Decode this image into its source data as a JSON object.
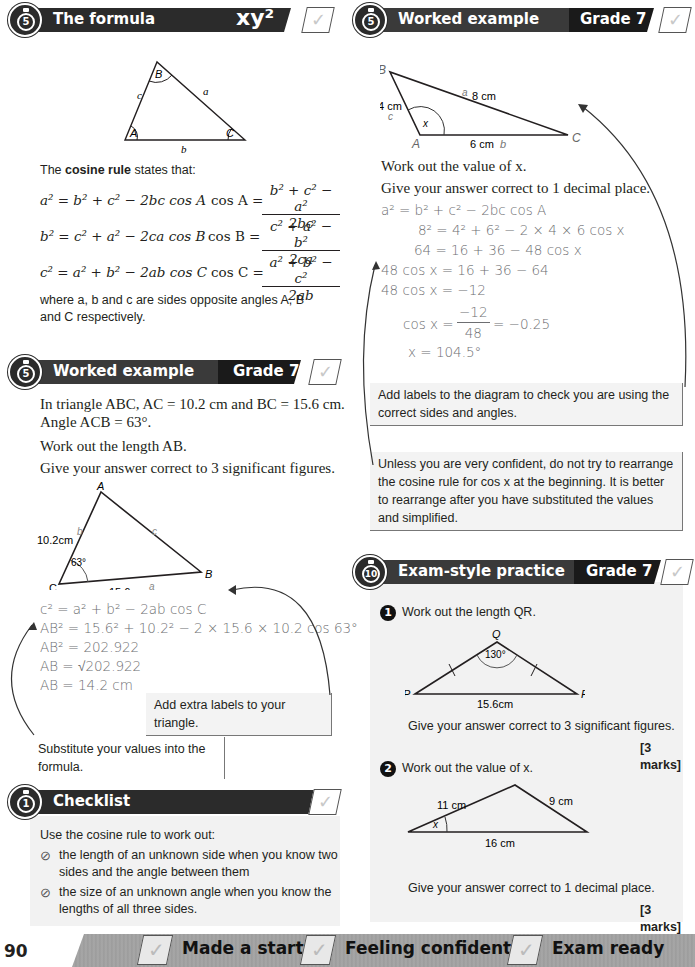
{
  "page_number": "90",
  "formula_section": {
    "timer": "5",
    "title": "The formula",
    "badge": "xy²",
    "triangle": {
      "vertices": [
        "A",
        "B",
        "C"
      ],
      "sides": [
        "a",
        "b",
        "c"
      ]
    },
    "intro_pre": "The ",
    "intro_bold": "cosine rule",
    "intro_post": " states that:",
    "rules": [
      {
        "lhs": "a² = b² + c² − 2bc cos A",
        "cos": "cos A =",
        "num": "b² + c² − a²",
        "den": "2bc"
      },
      {
        "lhs": "b² = c² + a² − 2ca cos B",
        "cos": "cos B =",
        "num": "c² + a² − b²",
        "den": "2ca"
      },
      {
        "lhs": "c² = a² + b² − 2ab cos C",
        "cos": "cos C =",
        "num": "a² + b² − c²",
        "den": "2ab"
      }
    ],
    "where": "where a, b and c are sides opposite angles A, B and C respectively."
  },
  "worked_example_1": {
    "timer": "5",
    "title": "Worked example",
    "grade": "Grade 7",
    "question": [
      "In triangle ABC, AC = 10.2 cm and BC = 15.6 cm. Angle ACB = 63°.",
      "Work out the length AB.",
      "Give your answer correct to 3 significant figures."
    ],
    "triangle": {
      "A": "A",
      "B": "B",
      "C": "C",
      "side_b": "b",
      "side_c": "c",
      "side_a": "a",
      "len_ac": "10.2 cm",
      "len_bc": "15.6 cm",
      "angle": "63°"
    },
    "working": [
      "c² = a² + b² − 2ab cos C",
      "AB² = 15.6² + 10.2² − 2 × 15.6 × 10.2 cos 63°",
      "AB² = 202.922",
      "AB = √202.922",
      "AB = 14.2 cm"
    ],
    "note_labels": "Add extra labels to your triangle.",
    "note_substitute": "Substitute your values into the formula."
  },
  "checklist": {
    "timer": "1",
    "title": "Checklist",
    "intro": "Use the cosine rule to work out:",
    "items": [
      "the length of an unknown side when you know two sides and the angle between them",
      "the size of an unknown angle when you know the lengths of all three sides."
    ]
  },
  "worked_example_2": {
    "timer": "5",
    "title": "Worked example",
    "grade": "Grade 7",
    "triangle": {
      "B": "B",
      "A": "A",
      "C": "C",
      "a": "a",
      "b": "b",
      "c": "c",
      "len_bc": "8 cm",
      "len_ab": "4 cm",
      "len_ac": "6 cm",
      "angle": "x"
    },
    "question": [
      "Work out the value of x.",
      "Give your answer correct to 1 decimal place."
    ],
    "working": [
      "a² = b² + c² − 2bc cos A",
      "8² = 4² + 6² − 2 × 4 × 6 cos x",
      "64 = 16 + 36 − 48 cos x",
      "48 cos x = 16 + 36 − 64",
      "48 cos x = −12",
      "cos x =",
      "−12",
      "48",
      "= −0.25",
      "x = 104.5°"
    ],
    "note_labels": "Add labels to the diagram to check you are using the correct sides and angles.",
    "note_rearrange": "Unless you are very confident, do not try to rearrange the cosine rule for cos x at the beginning. It is better to rearrange after you have substituted the values and simplified."
  },
  "exam_practice": {
    "timer": "10",
    "title": "Exam-style practice",
    "grade": "Grade 7",
    "questions": [
      {
        "num": "1",
        "text": "Work out the length QR.",
        "instr": "Give your answer correct to 3 significant figures.",
        "marks": "[3 marks]",
        "diagram": {
          "P": "P",
          "Q": "Q",
          "R": "R",
          "angle": "130°",
          "base": "15.6 cm"
        }
      },
      {
        "num": "2",
        "text": "Work out the value of x.",
        "instr": "Give your answer correct to 1 decimal place.",
        "marks": "[3 marks]",
        "diagram": {
          "left": "11 cm",
          "right": "9 cm",
          "base": "16 cm",
          "angle": "x"
        }
      }
    ]
  },
  "footer": {
    "items": [
      "Made a start",
      "Feeling confident",
      "Exam ready"
    ]
  }
}
